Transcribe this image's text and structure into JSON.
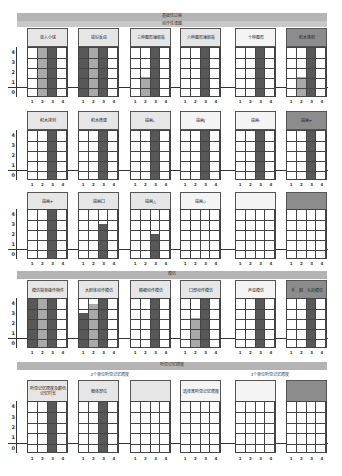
{
  "colors": {
    "dark": "#585858",
    "light": "#a9a9a9",
    "band": "#b4b4b4",
    "head_default": "#e6e6e6",
    "head_light": "#f4f4f4",
    "head_dark": "#8c8c8c",
    "grid": "#444444"
  },
  "bands": {
    "top": "基础性过程",
    "top_sub": "动作性课题",
    "middle": "模仿",
    "bottom": "听觉记忆跨度",
    "bottom_sub_left": "2个单位听觉记忆跨度",
    "bottom_sub_right": "3个单位听觉记忆跨度"
  },
  "y_ticks": [
    "4",
    "3",
    "2",
    "1",
    "0"
  ],
  "x_ticks": [
    "1",
    "2",
    "3",
    "4"
  ],
  "chart_data": {
    "type": "bar",
    "title": "基础性过程",
    "ylim": [
      0,
      4
    ],
    "yticks": [
      0,
      1,
      2,
      3,
      4
    ],
    "categories": [
      "1",
      "2",
      "3",
      "4"
    ],
    "grid": true,
    "groups": [
      {
        "section": "动作性课题",
        "panels": [
          {
            "label": "放入小球",
            "values": [
              0,
              4,
              4,
              0
            ],
            "shades": [
              "",
              "light",
              "dark",
              ""
            ]
          },
          {
            "label": "摇铃反应",
            "values": [
              4,
              4,
              4,
              0
            ],
            "shades": [
              "dark",
              "light",
              "dark",
              ""
            ]
          },
          {
            "label": "三种图形镶嵌板",
            "values": [
              0,
              1,
              4,
              0
            ],
            "shades": [
              "",
              "light",
              "dark",
              ""
            ]
          },
          {
            "label": "六种图形镶嵌板",
            "values": [
              0,
              0,
              4,
              0
            ],
            "shades": [
              "",
              "",
              "dark",
              ""
            ]
          },
          {
            "label": "十种图形",
            "values": [
              0,
              0,
              4,
              0
            ],
            "shades": [
              "",
              "",
              "dark",
              ""
            ]
          },
          {
            "label": "积木堆积",
            "values": [
              0,
              1,
              4,
              0
            ],
            "shades": [
              "",
              "light",
              "dark",
              ""
            ]
          },
          {
            "label": "积木排列",
            "values": [
              0,
              0,
              4,
              0
            ],
            "shades": [
              "",
              "",
              "dark",
              ""
            ]
          },
          {
            "label": "积木搭建",
            "values": [
              0,
              0,
              4,
              0
            ],
            "shades": [
              "",
              "",
              "dark",
              ""
            ]
          },
          {
            "label": "描画。",
            "values": [
              0,
              0,
              4,
              0
            ],
            "shades": [
              "",
              "",
              "dark",
              ""
            ]
          },
          {
            "label": "描画|",
            "values": [
              0,
              0,
              4,
              0
            ],
            "shades": [
              "",
              "",
              "dark",
              ""
            ]
          },
          {
            "label": "描画–",
            "values": [
              0,
              0,
              4,
              0
            ],
            "shades": [
              "",
              "",
              "dark",
              ""
            ]
          },
          {
            "label": "描画+",
            "values": [
              0,
              0,
              4,
              0
            ],
            "shades": [
              "",
              "",
              "dark",
              ""
            ]
          },
          {
            "label": "描画+",
            "values": [
              0,
              0,
              4,
              0
            ],
            "shades": [
              "",
              "",
              "dark",
              ""
            ]
          },
          {
            "label": "描画口",
            "values": [
              0,
              0,
              2.5,
              0
            ],
            "shades": [
              "",
              "",
              "dark",
              ""
            ]
          },
          {
            "label": "描画△",
            "values": [
              0,
              0,
              1.5,
              0
            ],
            "shades": [
              "",
              "",
              "dark",
              ""
            ]
          },
          {
            "label": "描画◇",
            "values": [
              0,
              0,
              0,
              0
            ],
            "shades": [
              "",
              "",
              "",
              ""
            ]
          },
          {
            "label": "",
            "values": [
              0,
              0,
              0,
              0
            ],
            "shades": [
              "",
              "",
              "",
              ""
            ]
          },
          {
            "label": "",
            "values": [
              0,
              0,
              0,
              0
            ],
            "shades": [
              "",
              "",
              "",
              ""
            ]
          }
        ]
      },
      {
        "section": "模仿",
        "panels": [
          {
            "label": "模仿简单操作物件",
            "values": [
              4,
              4,
              4,
              0
            ],
            "shades": [
              "dark",
              "light",
              "dark",
              ""
            ]
          },
          {
            "label": "大肢体动作模仿",
            "values": [
              2.5,
              3.5,
              4,
              0
            ],
            "shades": [
              "dark",
              "light",
              "dark",
              ""
            ]
          },
          {
            "label": "精细动作模仿",
            "values": [
              0,
              0,
              4,
              0
            ],
            "shades": [
              "",
              "",
              "dark",
              ""
            ]
          },
          {
            "label": "口部动作模仿",
            "values": [
              0,
              2,
              4,
              0
            ],
            "shades": [
              "",
              "light",
              "dark",
              ""
            ]
          },
          {
            "label": "声音模仿",
            "values": [
              0,
              0,
              4,
              0
            ],
            "shades": [
              "",
              "",
              "dark",
              ""
            ]
          },
          {
            "label": "手、脚、头的模仿",
            "values": [
              0,
              0,
              4,
              0
            ],
            "shades": [
              "",
              "",
              "dark",
              ""
            ]
          }
        ]
      },
      {
        "section": "听觉记忆跨度",
        "panels": [
          {
            "label": "听觉记忆跨度及颜色记忆时长",
            "values": [
              0,
              0,
              4,
              0
            ],
            "shades": [
              "",
              "",
              "dark",
              ""
            ]
          },
          {
            "label": "躯体部位",
            "values": [
              0,
              0,
              4,
              0
            ],
            "shades": [
              "",
              "",
              "dark",
              ""
            ]
          },
          {
            "label": "",
            "values": [
              0,
              0,
              0,
              0
            ],
            "shades": [
              "",
              "",
              "",
              ""
            ]
          },
          {
            "label": "选择离听觉记忆跨度",
            "values": [
              0,
              0,
              0,
              0
            ],
            "shades": [
              "",
              "",
              "",
              ""
            ]
          },
          {
            "label": "",
            "values": [
              0,
              0,
              0,
              0
            ],
            "shades": [
              "",
              "",
              "",
              ""
            ]
          },
          {
            "label": "",
            "values": [
              0,
              0,
              0,
              0
            ],
            "shades": [
              "",
              "",
              "",
              ""
            ]
          }
        ]
      }
    ]
  },
  "rows": [
    {
      "top": 28,
      "head_h": 17,
      "grid_top": 47,
      "grid_h": 50,
      "x_top": 99,
      "panels": [
        {
          "x": 27,
          "head": "default",
          "ref": "0.0"
        },
        {
          "x": 78,
          "head": "default",
          "ref": "0.1"
        },
        {
          "x": 130,
          "head": "default",
          "ref": "0.2"
        },
        {
          "x": 180,
          "head": "default",
          "ref": "0.3"
        },
        {
          "x": 235,
          "head": "light",
          "ref": "0.4"
        },
        {
          "x": 286,
          "head": "dark",
          "ref": "0.5"
        }
      ]
    },
    {
      "top": 111,
      "head_h": 17,
      "grid_top": 130,
      "grid_h": 50,
      "x_top": 182,
      "panels": [
        {
          "x": 27,
          "head": "default",
          "ref": "0.6"
        },
        {
          "x": 78,
          "head": "default",
          "ref": "0.7"
        },
        {
          "x": 130,
          "head": "default",
          "ref": "0.8"
        },
        {
          "x": 180,
          "head": "light",
          "ref": "0.9"
        },
        {
          "x": 235,
          "head": "light",
          "ref": "0.10"
        },
        {
          "x": 286,
          "head": "dark",
          "ref": "0.11"
        }
      ]
    },
    {
      "top": 192,
      "head_h": 17,
      "grid_top": 209,
      "grid_h": 50,
      "x_top": 261,
      "panels": [
        {
          "x": 27,
          "head": "default",
          "ref": "0.12"
        },
        {
          "x": 78,
          "head": "default",
          "ref": "0.13"
        },
        {
          "x": 130,
          "head": "default",
          "ref": "0.14"
        },
        {
          "x": 180,
          "head": "light",
          "ref": "0.15"
        },
        {
          "x": 235,
          "head": "light",
          "ref": "0.16"
        },
        {
          "x": 286,
          "head": "dark",
          "ref": "0.17"
        }
      ]
    },
    {
      "top": 280,
      "head_h": 18,
      "grid_top": 298,
      "grid_h": 50,
      "x_top": 350,
      "panels": [
        {
          "x": 27,
          "head": "default",
          "ref": "1.0"
        },
        {
          "x": 78,
          "head": "default",
          "ref": "1.1"
        },
        {
          "x": 130,
          "head": "default",
          "ref": "1.2"
        },
        {
          "x": 180,
          "head": "default",
          "ref": "1.3"
        },
        {
          "x": 235,
          "head": "light",
          "ref": "1.4"
        },
        {
          "x": 286,
          "head": "dark",
          "ref": "1.5"
        }
      ]
    },
    {
      "top": 380,
      "head_h": 20,
      "grid_top": 401,
      "grid_h": 52,
      "x_top": 456,
      "panels": [
        {
          "x": 27,
          "head": "default",
          "ref": "2.0"
        },
        {
          "x": 78,
          "head": "default",
          "ref": "2.1"
        },
        {
          "x": 130,
          "head": "default",
          "ref": "2.2"
        },
        {
          "x": 180,
          "head": "light",
          "ref": "2.3"
        },
        {
          "x": 235,
          "head": "light",
          "ref": "2.4"
        },
        {
          "x": 286,
          "head": "dark",
          "ref": "2.5"
        }
      ]
    }
  ]
}
